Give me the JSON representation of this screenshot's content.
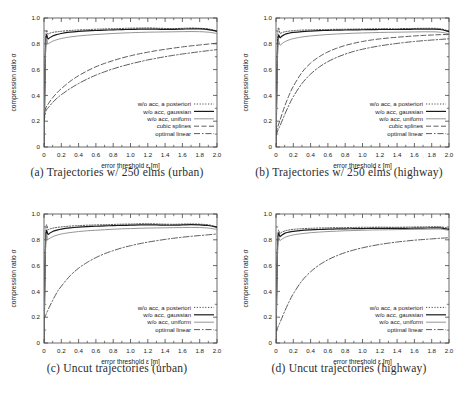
{
  "figure": {
    "panel_count": 4,
    "layout": "2x2 grid of line plots with serif sub-captions"
  },
  "axes": {
    "xlabel": "error threshold ε [m]",
    "ylabel": "compression ratio σ",
    "xticks": [
      "0",
      "0.2",
      "0.4",
      "0.6",
      "0.8",
      "1.0",
      "1.2",
      "1.4",
      "1.6",
      "1.8",
      "2.0"
    ],
    "yticks": [
      "0",
      "0.2",
      "0.4",
      "0.6",
      "0.8",
      "1.0"
    ],
    "xlim": [
      0,
      2.0
    ],
    "ylim": [
      0,
      1.0
    ],
    "grid": false,
    "tick_direction": "in",
    "minor_ticks": true
  },
  "series_styles": {
    "a_posteriori": {
      "label": "w/o acc, a posteriori",
      "dash": "1.2 1.6",
      "color": "#3a3a3a",
      "width": 0.9
    },
    "gaussian": {
      "label": "w/o acc, gaussian",
      "dash": "none",
      "color": "#1a1a1a",
      "width": 1.2
    },
    "uniform": {
      "label": "w/o acc, uniform",
      "dash": "none",
      "color": "#8a8a8a",
      "width": 0.9
    },
    "cubic": {
      "label": "cubic splines",
      "dash": "5 2.5",
      "color": "#4a4a4a",
      "width": 0.9
    },
    "optimal": {
      "label": "optimal linear",
      "dash": "6 2 1.5 2",
      "color": "#4a4a4a",
      "width": 0.9
    }
  },
  "captions": {
    "a": "(a) Trajectories w/ 250 elms (urban)",
    "b": "(b) Trajectories w/ 250 elms (highway)",
    "c": "(c) Uncut trajectories (urban)",
    "d": "(d) Uncut trajectories (highway)"
  },
  "chart_data": [
    {
      "id": "a",
      "type": "line",
      "title": "(a) Trajectories w/ 250 elms (urban)",
      "xlabel": "error threshold ε [m]",
      "ylabel": "compression ratio σ",
      "xlim": [
        0,
        2.0
      ],
      "ylim": [
        0,
        1.0
      ],
      "legend_position": "lower right inside",
      "x": [
        0,
        0.02,
        0.05,
        0.1,
        0.15,
        0.2,
        0.3,
        0.4,
        0.5,
        0.6,
        0.7,
        0.8,
        0.9,
        1.0,
        1.1,
        1.2,
        1.3,
        1.4,
        1.5,
        1.6,
        1.7,
        1.8,
        1.9,
        2.0
      ],
      "series": [
        {
          "name": "w/o acc, a posteriori",
          "values": [
            0.0,
            0.83,
            0.875,
            0.888,
            0.893,
            0.897,
            0.903,
            0.907,
            0.91,
            0.913,
            0.915,
            0.917,
            0.919,
            0.921,
            0.922,
            0.923,
            0.921,
            0.919,
            0.918,
            0.92,
            0.922,
            0.92,
            0.915,
            0.9
          ]
        },
        {
          "name": "w/o acc, gaussian",
          "values": [
            0.0,
            0.8,
            0.838,
            0.86,
            0.872,
            0.88,
            0.89,
            0.896,
            0.9,
            0.903,
            0.906,
            0.908,
            0.91,
            0.912,
            0.913,
            0.914,
            0.913,
            0.912,
            0.912,
            0.914,
            0.916,
            0.915,
            0.91,
            0.898
          ]
        },
        {
          "name": "w/o acc, uniform",
          "values": [
            0.0,
            0.78,
            0.8,
            0.82,
            0.832,
            0.841,
            0.853,
            0.861,
            0.867,
            0.872,
            0.876,
            0.88,
            0.883,
            0.886,
            0.888,
            0.89,
            0.891,
            0.892,
            0.893,
            0.894,
            0.895,
            0.894,
            0.89,
            0.88
          ]
        },
        {
          "name": "cubic splines",
          "values": [
            0.22,
            0.3,
            0.335,
            0.382,
            0.42,
            0.452,
            0.508,
            0.553,
            0.59,
            0.622,
            0.648,
            0.67,
            0.69,
            0.707,
            0.722,
            0.735,
            0.747,
            0.757,
            0.767,
            0.776,
            0.784,
            0.791,
            0.798,
            0.805
          ]
        },
        {
          "name": "optimal linear",
          "values": [
            0.19,
            0.275,
            0.305,
            0.345,
            0.378,
            0.405,
            0.452,
            0.492,
            0.527,
            0.557,
            0.583,
            0.606,
            0.626,
            0.644,
            0.66,
            0.675,
            0.688,
            0.7,
            0.711,
            0.721,
            0.73,
            0.739,
            0.747,
            0.755
          ]
        }
      ]
    },
    {
      "id": "b",
      "type": "line",
      "title": "(b) Trajectories w/ 250 elms (highway)",
      "xlabel": "error threshold ε [m]",
      "ylabel": "compression ratio σ",
      "xlim": [
        0,
        2.0
      ],
      "ylim": [
        0,
        1.0
      ],
      "legend_position": "lower right inside",
      "x": [
        0,
        0.02,
        0.05,
        0.1,
        0.15,
        0.2,
        0.3,
        0.4,
        0.5,
        0.6,
        0.7,
        0.8,
        0.9,
        1.0,
        1.1,
        1.2,
        1.3,
        1.4,
        1.5,
        1.6,
        1.7,
        1.8,
        1.9,
        2.0
      ],
      "series": [
        {
          "name": "w/o acc, a posteriori",
          "values": [
            0.0,
            0.855,
            0.88,
            0.893,
            0.898,
            0.902,
            0.906,
            0.908,
            0.91,
            0.911,
            0.912,
            0.913,
            0.914,
            0.915,
            0.916,
            0.917,
            0.917,
            0.917,
            0.918,
            0.919,
            0.92,
            0.92,
            0.917,
            0.898
          ]
        },
        {
          "name": "w/o acc, gaussian",
          "values": [
            0.0,
            0.79,
            0.848,
            0.872,
            0.882,
            0.888,
            0.895,
            0.899,
            0.902,
            0.904,
            0.906,
            0.907,
            0.908,
            0.909,
            0.91,
            0.911,
            0.911,
            0.911,
            0.912,
            0.913,
            0.914,
            0.914,
            0.911,
            0.894
          ]
        },
        {
          "name": "w/o acc, uniform",
          "values": [
            0.0,
            0.76,
            0.79,
            0.815,
            0.83,
            0.84,
            0.853,
            0.861,
            0.867,
            0.872,
            0.876,
            0.879,
            0.882,
            0.884,
            0.886,
            0.888,
            0.889,
            0.89,
            0.891,
            0.892,
            0.893,
            0.893,
            0.89,
            0.878
          ]
        },
        {
          "name": "cubic splines",
          "values": [
            0.105,
            0.155,
            0.215,
            0.315,
            0.4,
            0.47,
            0.578,
            0.65,
            0.7,
            0.737,
            0.765,
            0.787,
            0.804,
            0.818,
            0.829,
            0.838,
            0.845,
            0.851,
            0.856,
            0.861,
            0.865,
            0.868,
            0.871,
            0.872
          ]
        },
        {
          "name": "optimal linear",
          "values": [
            0.09,
            0.125,
            0.17,
            0.25,
            0.325,
            0.39,
            0.492,
            0.565,
            0.62,
            0.662,
            0.694,
            0.72,
            0.741,
            0.758,
            0.772,
            0.784,
            0.794,
            0.803,
            0.811,
            0.818,
            0.824,
            0.829,
            0.834,
            0.839
          ]
        }
      ]
    },
    {
      "id": "c",
      "type": "line",
      "title": "(c) Uncut trajectories (urban)",
      "xlabel": "error threshold ε [m]",
      "ylabel": "compression ratio σ",
      "xlim": [
        0,
        2.0
      ],
      "ylim": [
        0,
        1.0
      ],
      "legend_position": "lower right inside",
      "x": [
        0,
        0.02,
        0.05,
        0.1,
        0.15,
        0.2,
        0.3,
        0.4,
        0.5,
        0.6,
        0.7,
        0.8,
        0.9,
        1.0,
        1.1,
        1.2,
        1.3,
        1.4,
        1.5,
        1.6,
        1.7,
        1.8,
        1.9,
        2.0
      ],
      "series": [
        {
          "name": "w/o acc, a posteriori",
          "values": [
            0.0,
            0.845,
            0.878,
            0.89,
            0.896,
            0.9,
            0.906,
            0.91,
            0.913,
            0.915,
            0.917,
            0.919,
            0.921,
            0.922,
            0.924,
            0.925,
            0.923,
            0.921,
            0.92,
            0.922,
            0.923,
            0.921,
            0.916,
            0.9
          ]
        },
        {
          "name": "w/o acc, gaussian",
          "values": [
            0.0,
            0.8,
            0.842,
            0.864,
            0.875,
            0.883,
            0.892,
            0.898,
            0.902,
            0.905,
            0.908,
            0.91,
            0.912,
            0.913,
            0.915,
            0.916,
            0.915,
            0.913,
            0.913,
            0.915,
            0.917,
            0.915,
            0.911,
            0.898
          ]
        },
        {
          "name": "w/o acc, uniform",
          "values": [
            0.0,
            0.78,
            0.804,
            0.824,
            0.836,
            0.845,
            0.856,
            0.864,
            0.87,
            0.874,
            0.878,
            0.882,
            0.885,
            0.887,
            0.889,
            0.891,
            0.892,
            0.893,
            0.894,
            0.895,
            0.896,
            0.895,
            0.891,
            0.88
          ]
        },
        {
          "name": "optimal linear",
          "values": [
            0.185,
            0.215,
            0.262,
            0.33,
            0.392,
            0.44,
            0.52,
            0.58,
            0.625,
            0.662,
            0.692,
            0.716,
            0.737,
            0.754,
            0.769,
            0.782,
            0.793,
            0.803,
            0.812,
            0.82,
            0.827,
            0.833,
            0.839,
            0.845
          ]
        }
      ]
    },
    {
      "id": "d",
      "type": "line",
      "title": "(d) Uncut trajectories (highway)",
      "xlabel": "error threshold ε [m]",
      "ylabel": "compression ratio σ",
      "xlim": [
        0,
        2.0
      ],
      "ylim": [
        0,
        1.0
      ],
      "legend_position": "lower right inside",
      "x": [
        0,
        0.02,
        0.05,
        0.1,
        0.15,
        0.2,
        0.3,
        0.4,
        0.5,
        0.6,
        0.7,
        0.8,
        0.9,
        1.0,
        1.1,
        1.2,
        1.3,
        1.4,
        1.5,
        1.6,
        1.7,
        1.8,
        1.9,
        2.0
      ],
      "series": [
        {
          "name": "w/o acc, a posteriori",
          "values": [
            0.0,
            0.8,
            0.85,
            0.868,
            0.876,
            0.881,
            0.886,
            0.889,
            0.891,
            0.893,
            0.894,
            0.895,
            0.896,
            0.897,
            0.897,
            0.898,
            0.897,
            0.897,
            0.898,
            0.899,
            0.9,
            0.901,
            0.901,
            0.888
          ]
        },
        {
          "name": "w/o acc, gaussian",
          "values": [
            0.0,
            0.78,
            0.826,
            0.85,
            0.86,
            0.866,
            0.873,
            0.877,
            0.88,
            0.882,
            0.884,
            0.885,
            0.886,
            0.887,
            0.888,
            0.889,
            0.888,
            0.888,
            0.889,
            0.89,
            0.891,
            0.892,
            0.892,
            0.88
          ]
        },
        {
          "name": "w/o acc, uniform",
          "values": [
            0.0,
            0.762,
            0.795,
            0.818,
            0.83,
            0.838,
            0.848,
            0.855,
            0.86,
            0.864,
            0.867,
            0.87,
            0.872,
            0.874,
            0.876,
            0.877,
            0.878,
            0.879,
            0.88,
            0.881,
            0.882,
            0.883,
            0.883,
            0.873
          ]
        },
        {
          "name": "optimal linear",
          "values": [
            0.09,
            0.12,
            0.165,
            0.245,
            0.318,
            0.382,
            0.482,
            0.552,
            0.605,
            0.645,
            0.676,
            0.701,
            0.721,
            0.738,
            0.752,
            0.764,
            0.774,
            0.783,
            0.79,
            0.797,
            0.802,
            0.807,
            0.812,
            0.816
          ]
        }
      ]
    }
  ]
}
